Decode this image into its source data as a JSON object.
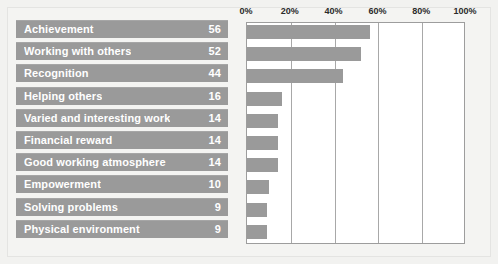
{
  "chart_data": {
    "type": "bar",
    "orientation": "horizontal",
    "title": "",
    "subtitle": "",
    "xlabel": "",
    "ylabel": "",
    "xlim": [
      0,
      100
    ],
    "grid": true,
    "legend": null,
    "value_unit": "%",
    "xticks": [
      "0%",
      "20%",
      "40%",
      "60%",
      "80%",
      "100%"
    ],
    "xtick_values": [
      0,
      20,
      40,
      60,
      80,
      100
    ],
    "categories": [
      "Achievement",
      "Working with others",
      "Recognition",
      "Helping others",
      "Varied and interesting work",
      "Financial reward",
      "Good working atmosphere",
      "Empowerment",
      "Solving problems",
      "Physical environment"
    ],
    "values": [
      56,
      52,
      44,
      16,
      14,
      14,
      14,
      10,
      9,
      9
    ],
    "bar_color": "#9a9a9a",
    "label_band_color": "#9a9a9a",
    "label_text_color": "#ffffff",
    "plot_background": "#ffffff",
    "figure_background": "#f2f2f0"
  }
}
